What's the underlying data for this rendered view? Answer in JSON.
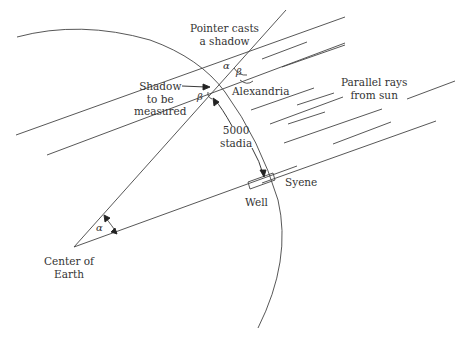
{
  "diagram": {
    "labels": {
      "pointer": [
        "Pointer casts",
        "a shadow"
      ],
      "shadow": [
        "Shadow",
        "to be",
        "measured"
      ],
      "alexandria": "Alexandria",
      "distance": [
        "5000",
        "stadia"
      ],
      "rays": [
        "Parallel rays",
        "from sun"
      ],
      "syene": "Syene",
      "well": "Well",
      "center": [
        "Center of",
        "Earth"
      ]
    },
    "symbols": {
      "alpha": "α",
      "beta": "β"
    },
    "colors": {
      "line": "#444444",
      "text": "#333333",
      "background": "#ffffff"
    }
  }
}
